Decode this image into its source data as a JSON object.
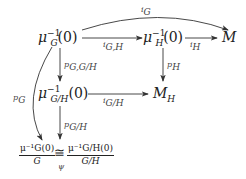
{
  "nodes": {
    "muG": {
      "base": "μ",
      "sub": "G",
      "sup": "−1",
      "arg": "(0)"
    },
    "muH": {
      "base": "μ",
      "sub": "H",
      "sup": "−1",
      "arg": "(0)"
    },
    "M": "M",
    "muGH": {
      "base": "μ",
      "sub": "G/H",
      "sup": "−1",
      "arg": "(0)"
    },
    "MH": {
      "base": "M",
      "sub": "H"
    },
    "quot_left": {
      "num": "μ⁻¹G(0)",
      "den": "G"
    },
    "iso": "≅",
    "iso_label": "ψ",
    "quot_right": {
      "num": "μ⁻¹G/H(0)",
      "den": "G/H"
    }
  },
  "arrows": {
    "iG": "i_G",
    "iGH": "i_{G,H}",
    "iH": "i_H",
    "pGGH": "p_{G,G/H}",
    "pH": "p_H",
    "iGslashH": "i_{G/H}",
    "pG": "p_G",
    "pGslashH": "p_{G/H}"
  },
  "labels": {
    "iG": {
      "b": "i",
      "s": "G"
    },
    "iGH": {
      "b": "i",
      "s": "G,H"
    },
    "iH": {
      "b": "i",
      "s": "H"
    },
    "pGGH": {
      "b": "p",
      "s": "G,G/H"
    },
    "pH": {
      "b": "p",
      "s": "H"
    },
    "iGslashH": {
      "b": "i",
      "s": "G/H"
    },
    "pG": {
      "b": "p",
      "s": "G"
    },
    "pGslashH": {
      "b": "p",
      "s": "G/H"
    }
  }
}
